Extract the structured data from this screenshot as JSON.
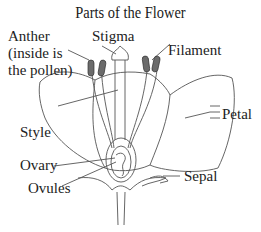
{
  "diagram": {
    "title": "Parts of the Flower",
    "labels": {
      "anther_line1": "Anther",
      "anther_line2": "(inside is",
      "anther_line3": "the pollen)",
      "stigma": "Stigma",
      "filament": "Filament",
      "petal": "Petal",
      "style": "Style",
      "ovary": "Ovary",
      "sepal": "Sepal",
      "ovules": "Ovules"
    },
    "colors": {
      "line": "#555555",
      "anther_fill": "#6b6b6b",
      "text": "#222222"
    }
  }
}
